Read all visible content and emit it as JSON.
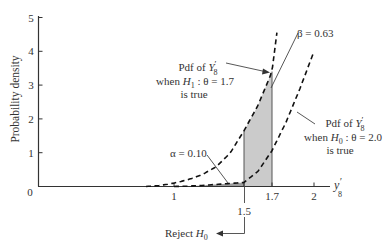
{
  "chart_data": {
    "type": "area",
    "title": "",
    "xlabel": "y'_8",
    "ylabel": "Probability density",
    "xlim": [
      0,
      2.1
    ],
    "ylim": [
      0,
      5
    ],
    "x_ticks": [
      {
        "value": 1,
        "label": "1"
      },
      {
        "value": 1.5,
        "label": "1.5"
      },
      {
        "value": 1.7,
        "label": "1.7"
      },
      {
        "value": 2,
        "label": "2"
      }
    ],
    "y_ticks": [
      {
        "value": 1,
        "label": "1"
      },
      {
        "value": 2,
        "label": "2"
      },
      {
        "value": 3,
        "label": "3"
      },
      {
        "value": 4,
        "label": "4"
      },
      {
        "value": 5,
        "label": "5"
      }
    ],
    "origin_label": "0",
    "grid": false,
    "series": [
      {
        "name": "Pdf of Y'_8 when H1: θ = 1.7 is true",
        "style": "dashed",
        "x": [
          0.8,
          0.9,
          1.0,
          1.1,
          1.2,
          1.3,
          1.4,
          1.5,
          1.6,
          1.7,
          1.735
        ],
        "y": [
          0.0,
          0.03,
          0.1,
          0.2,
          0.35,
          0.58,
          0.98,
          1.65,
          2.4,
          3.4,
          4.55
        ]
      },
      {
        "name": "Pdf of Y'_8 when H0: θ = 2.0 is true",
        "style": "dashed",
        "x": [
          1.0,
          1.1,
          1.2,
          1.3,
          1.4,
          1.5,
          1.6,
          1.7,
          1.8,
          1.9,
          2.0
        ],
        "y": [
          0.0,
          0.01,
          0.03,
          0.06,
          0.09,
          0.12,
          0.45,
          1.06,
          1.9,
          2.9,
          4.0
        ]
      }
    ],
    "shaded_regions": [
      {
        "name": "alpha",
        "label": "α = 0.10",
        "under": "H0",
        "x_range": [
          0.9,
          1.5
        ],
        "color": "#9c9c9c"
      },
      {
        "name": "beta",
        "label": "β = 0.63",
        "under": "H1",
        "x_range": [
          1.5,
          1.7
        ],
        "color": "#cbcbcb"
      }
    ],
    "annotations": [
      {
        "text": "β = 0.63",
        "points_to": "beta region"
      },
      {
        "text": "α = 0.10",
        "points_to": "alpha region"
      },
      {
        "text": "Pdf of Y'_8 when H1: θ = 1.7 is true",
        "points_to": "H1 curve"
      },
      {
        "text": "Pdf of Y'_8 when H0: θ = 2.0 is true",
        "points_to": "H0 curve"
      },
      {
        "text": "Reject H0",
        "arrow_from": 1.5,
        "direction": "left"
      }
    ],
    "legend_position": "none"
  },
  "labels": {
    "ylabel": "Probability density",
    "origin": "0",
    "xlabel_main": "y",
    "xlabel_prime": "′",
    "xlabel_sub": "8",
    "beta": "β = 0.63",
    "alpha": "α = 0.10",
    "h1_line1_pre": "Pdf of ",
    "h1_line1_var": "Y",
    "h1_line1_prime": "′",
    "h1_line1_sub": "8",
    "h1_line2_pre": "when ",
    "h1_line2_var": "H",
    "h1_line2_sub": "1",
    "h1_line2_post": " : θ = 1.7",
    "h1_line3": "is true",
    "h0_line1_pre": "Pdf of ",
    "h0_line1_var": "Y",
    "h0_line1_prime": "′",
    "h0_line1_sub": "8",
    "h0_line2_pre": "when ",
    "h0_line2_var": "H",
    "h0_line2_sub": "0",
    "h0_line2_post": " : θ = 2.0",
    "h0_line3": "is true",
    "reject_pre": "Reject ",
    "reject_var": "H",
    "reject_sub": "0"
  },
  "colors": {
    "axis": "#333333",
    "curve": "#111111",
    "alpha_fill": "#9c9c9c",
    "beta_fill": "#cbcbcb"
  }
}
